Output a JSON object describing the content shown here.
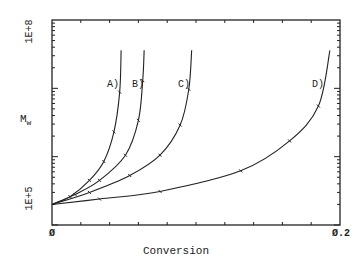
{
  "chart_data": {
    "type": "line",
    "title": "",
    "xlabel": "Conversion",
    "ylabel": "Mw",
    "ylabel_main": "M",
    "ylabel_sub": "w",
    "xlim": [
      0,
      0.2
    ],
    "ylim": [
      100000,
      100000000
    ],
    "yscale": "log",
    "x_tick_labels": [
      "Ø",
      "Ø.2"
    ],
    "y_tick_labels": [
      "1E+5",
      "1E+8"
    ],
    "grid": false,
    "legend": "inline labels",
    "series": [
      {
        "name": "A)",
        "x": [
          0,
          0.0125,
          0.026,
          0.036,
          0.043,
          0.047,
          0.048
        ],
        "y": [
          200000,
          260000,
          450000,
          850000,
          2300000,
          8800000,
          36000000
        ]
      },
      {
        "name": "B)",
        "x": [
          0,
          0.016,
          0.033,
          0.051,
          0.06,
          0.063,
          0.064
        ],
        "y": [
          200000,
          280000,
          450000,
          1050000,
          3400000,
          13000000,
          36000000
        ]
      },
      {
        "name": "C)",
        "x": [
          0,
          0.026,
          0.054,
          0.075,
          0.089,
          0.095,
          0.097
        ],
        "y": [
          200000,
          300000,
          530000,
          1050000,
          2900000,
          9700000,
          36000000
        ]
      },
      {
        "name": "D)",
        "x": [
          0,
          0.033,
          0.075,
          0.131,
          0.165,
          0.185,
          0.193
        ],
        "y": [
          200000,
          240000,
          310000,
          620000,
          1700000,
          5500000,
          36000000
        ]
      }
    ]
  },
  "labels": {
    "x_axis_title": "Conversion",
    "y_axis_main": "M",
    "y_axis_sub": "w",
    "x_min": "Ø",
    "x_max": "Ø.2",
    "y_min": "1E+5",
    "y_max": "1E+8",
    "series_A": "A)",
    "series_B": "B)",
    "series_C": "C)",
    "series_D": "D)"
  }
}
